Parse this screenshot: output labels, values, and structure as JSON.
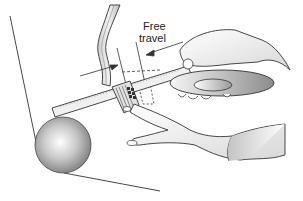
{
  "diagram": {
    "labels": {
      "line1": "Free",
      "line2": "travel"
    },
    "parts": [
      "floor-panel",
      "pedal-arm",
      "ruler",
      "pedal-pad",
      "steering-wheel-hub",
      "hand-holding-ruler",
      "hand-pressing-pedal",
      "ball-sphere"
    ],
    "colors": {
      "line": "#333333",
      "shade_light": "#e6e6e6",
      "shade_mid": "#bdbdbd",
      "shade_dark": "#8a8a8a"
    }
  }
}
